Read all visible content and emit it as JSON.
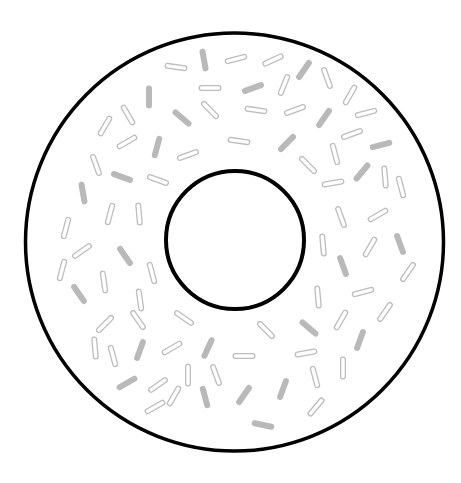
{
  "illustration": {
    "subject": "donut with sprinkles",
    "background": "#ffffff",
    "outline_color": "#000000",
    "sprinkle_color": "#bbbbbb",
    "outer_circle": {
      "cx": 234.5,
      "cy": 242,
      "r": 209,
      "stroke_width": 3.5
    },
    "inner_circle": {
      "cx": 235,
      "cy": 240,
      "r": 69,
      "stroke_width": 4
    },
    "sprinkles": [
      {
        "x": 204,
        "y": 60,
        "a": 80,
        "s": 1
      },
      {
        "x": 176,
        "y": 67,
        "a": 8,
        "s": 0
      },
      {
        "x": 236,
        "y": 59,
        "a": -15,
        "s": 0
      },
      {
        "x": 273,
        "y": 60,
        "a": -25,
        "s": 0
      },
      {
        "x": 304,
        "y": 70,
        "a": -55,
        "s": 1
      },
      {
        "x": 327,
        "y": 78,
        "a": 70,
        "s": 0
      },
      {
        "x": 284,
        "y": 85,
        "a": -68,
        "s": 0
      },
      {
        "x": 253,
        "y": 88,
        "a": -20,
        "s": 1
      },
      {
        "x": 210,
        "y": 88,
        "a": 0,
        "s": 0
      },
      {
        "x": 350,
        "y": 95,
        "a": -60,
        "s": 0
      },
      {
        "x": 149,
        "y": 97,
        "a": 90,
        "s": 1
      },
      {
        "x": 128,
        "y": 115,
        "a": 60,
        "s": 0
      },
      {
        "x": 182,
        "y": 118,
        "a": 40,
        "s": 1
      },
      {
        "x": 210,
        "y": 110,
        "a": 45,
        "s": 0
      },
      {
        "x": 256,
        "y": 110,
        "a": 8,
        "s": 0
      },
      {
        "x": 295,
        "y": 110,
        "a": -20,
        "s": 0
      },
      {
        "x": 324,
        "y": 118,
        "a": -55,
        "s": 1
      },
      {
        "x": 366,
        "y": 113,
        "a": -15,
        "s": 0
      },
      {
        "x": 105,
        "y": 126,
        "a": -60,
        "s": 0
      },
      {
        "x": 127,
        "y": 142,
        "a": -30,
        "s": 0
      },
      {
        "x": 157,
        "y": 147,
        "a": -75,
        "s": 1
      },
      {
        "x": 239,
        "y": 141,
        "a": 8,
        "s": 0
      },
      {
        "x": 188,
        "y": 155,
        "a": -20,
        "s": 0
      },
      {
        "x": 287,
        "y": 143,
        "a": -45,
        "s": 1
      },
      {
        "x": 308,
        "y": 165,
        "a": 45,
        "s": 0
      },
      {
        "x": 352,
        "y": 134,
        "a": -20,
        "s": 0
      },
      {
        "x": 381,
        "y": 145,
        "a": -15,
        "s": 1
      },
      {
        "x": 335,
        "y": 154,
        "a": 75,
        "s": 0
      },
      {
        "x": 96,
        "y": 165,
        "a": 70,
        "s": 0
      },
      {
        "x": 122,
        "y": 177,
        "a": 20,
        "s": 1
      },
      {
        "x": 158,
        "y": 180,
        "a": 20,
        "s": 0
      },
      {
        "x": 362,
        "y": 172,
        "a": -50,
        "s": 1
      },
      {
        "x": 385,
        "y": 177,
        "a": 85,
        "s": 0
      },
      {
        "x": 333,
        "y": 183,
        "a": -10,
        "s": 0
      },
      {
        "x": 83,
        "y": 193,
        "a": 80,
        "s": 1
      },
      {
        "x": 110,
        "y": 214,
        "a": -75,
        "s": 0
      },
      {
        "x": 139,
        "y": 214,
        "a": 85,
        "s": 0
      },
      {
        "x": 401,
        "y": 187,
        "a": 75,
        "s": 0
      },
      {
        "x": 341,
        "y": 217,
        "a": 70,
        "s": 0
      },
      {
        "x": 378,
        "y": 215,
        "a": -30,
        "s": 0
      },
      {
        "x": 66,
        "y": 228,
        "a": -75,
        "s": 0
      },
      {
        "x": 82,
        "y": 251,
        "a": -35,
        "s": 0
      },
      {
        "x": 125,
        "y": 256,
        "a": 55,
        "s": 1
      },
      {
        "x": 323,
        "y": 245,
        "a": 85,
        "s": 0
      },
      {
        "x": 370,
        "y": 247,
        "a": -60,
        "s": 0
      },
      {
        "x": 400,
        "y": 244,
        "a": 70,
        "s": 1
      },
      {
        "x": 62,
        "y": 270,
        "a": -75,
        "s": 0
      },
      {
        "x": 152,
        "y": 273,
        "a": 75,
        "s": 0
      },
      {
        "x": 343,
        "y": 266,
        "a": 70,
        "s": 1
      },
      {
        "x": 408,
        "y": 272,
        "a": -55,
        "s": 0
      },
      {
        "x": 104,
        "y": 282,
        "a": 82,
        "s": 0
      },
      {
        "x": 79,
        "y": 294,
        "a": 55,
        "s": 1
      },
      {
        "x": 140,
        "y": 300,
        "a": 82,
        "s": 0
      },
      {
        "x": 318,
        "y": 297,
        "a": 85,
        "s": 0
      },
      {
        "x": 363,
        "y": 292,
        "a": -15,
        "s": 0
      },
      {
        "x": 385,
        "y": 312,
        "a": -55,
        "s": 0
      },
      {
        "x": 138,
        "y": 320,
        "a": 55,
        "s": 0
      },
      {
        "x": 105,
        "y": 324,
        "a": -45,
        "s": 0
      },
      {
        "x": 184,
        "y": 318,
        "a": 35,
        "s": 0
      },
      {
        "x": 266,
        "y": 330,
        "a": 45,
        "s": 0
      },
      {
        "x": 309,
        "y": 328,
        "a": 40,
        "s": 1
      },
      {
        "x": 341,
        "y": 320,
        "a": -60,
        "s": 0
      },
      {
        "x": 360,
        "y": 340,
        "a": -70,
        "s": 1
      },
      {
        "x": 95,
        "y": 348,
        "a": 85,
        "s": 0
      },
      {
        "x": 113,
        "y": 356,
        "a": 75,
        "s": 0
      },
      {
        "x": 140,
        "y": 350,
        "a": -70,
        "s": 1
      },
      {
        "x": 172,
        "y": 348,
        "a": -30,
        "s": 0
      },
      {
        "x": 208,
        "y": 348,
        "a": -65,
        "s": 1
      },
      {
        "x": 244,
        "y": 356,
        "a": 0,
        "s": 0
      },
      {
        "x": 306,
        "y": 353,
        "a": -10,
        "s": 0
      },
      {
        "x": 343,
        "y": 368,
        "a": 90,
        "s": 0
      },
      {
        "x": 188,
        "y": 375,
        "a": 90,
        "s": 0
      },
      {
        "x": 216,
        "y": 375,
        "a": 70,
        "s": 0
      },
      {
        "x": 127,
        "y": 383,
        "a": -30,
        "s": 1
      },
      {
        "x": 158,
        "y": 385,
        "a": -35,
        "s": 0
      },
      {
        "x": 315,
        "y": 377,
        "a": 75,
        "s": 0
      },
      {
        "x": 283,
        "y": 389,
        "a": -70,
        "s": 1
      },
      {
        "x": 244,
        "y": 395,
        "a": -55,
        "s": 1
      },
      {
        "x": 205,
        "y": 397,
        "a": 75,
        "s": 1
      },
      {
        "x": 174,
        "y": 396,
        "a": -60,
        "s": 0
      },
      {
        "x": 155,
        "y": 407,
        "a": -30,
        "s": 0
      },
      {
        "x": 316,
        "y": 407,
        "a": -50,
        "s": 0
      },
      {
        "x": 263,
        "y": 425,
        "a": 12,
        "s": 1
      }
    ]
  }
}
